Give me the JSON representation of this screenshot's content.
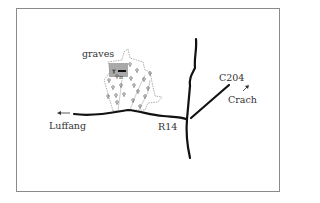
{
  "map": {
    "labels": {
      "graves": "graves",
      "luffang": "Luffang",
      "r14": "R14",
      "c204": "C204",
      "crach": "Crach"
    },
    "colors": {
      "road": "#111111",
      "frame": "#8a8a8a",
      "forest_outline": "#9a9a9a",
      "graves_area": "#8c8c8c",
      "text": "#333333"
    }
  }
}
